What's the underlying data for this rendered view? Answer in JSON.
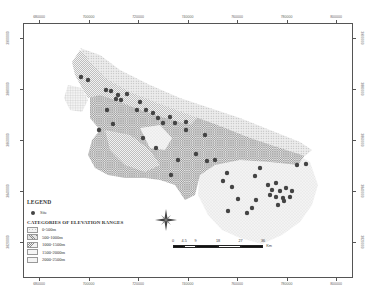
{
  "map": {
    "axes": {
      "x_ticks": [
        "680000",
        "700000",
        "720000",
        "740000",
        "760000",
        "780000",
        "800000"
      ],
      "y_ticks": [
        "3900000",
        "3880000",
        "3860000",
        "3840000",
        "3820000"
      ]
    },
    "legend": {
      "title": "LEGEND",
      "site_label": "Site",
      "categories_title": "CATEGORIES OF ELEVATION RANGES",
      "categories": [
        {
          "label": "0-500m",
          "pattern": "dots-light"
        },
        {
          "label": "500-1000m",
          "pattern": "crosshatch"
        },
        {
          "label": "1000-1500m",
          "pattern": "diagonal"
        },
        {
          "label": "1500-2000m",
          "pattern": "stipple"
        },
        {
          "label": "2000-2500m",
          "pattern": "grid"
        }
      ]
    },
    "scale_bar": {
      "labels": [
        "0",
        "4.5",
        "9",
        "18",
        "27",
        "36"
      ],
      "unit": "Km"
    },
    "north_arrow": "compass-rose",
    "colors": {
      "site": "#444444",
      "frame": "#555555"
    }
  }
}
